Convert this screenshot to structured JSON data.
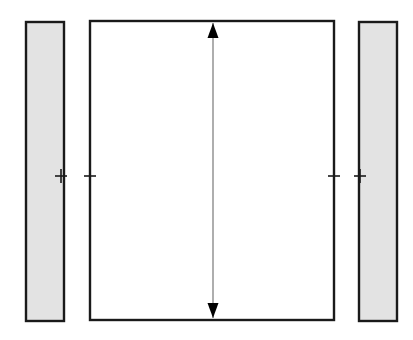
{
  "figure": {
    "type": "engineering-cross-section-diagram",
    "background_color": "#ffffff",
    "width": 413,
    "height": 340
  },
  "colors": {
    "outline": "#1a1a1a",
    "hatch_fill": "#e3e3e3",
    "panel_fill": "#ffffff",
    "arrow_shaft": "#8c8c8c",
    "arrow_head": "#000000",
    "tick_mark": "#1a1a1a"
  },
  "shapes": {
    "left_side_bar": {
      "label": "left-side-bar",
      "x": 26,
      "y": 22,
      "width": 38,
      "height": 299,
      "fill": "#e3e3e3",
      "stroke": "#1a1a1a",
      "stroke_width": 2.4
    },
    "center_panel": {
      "label": "center-panel",
      "x": 90,
      "y": 21,
      "width": 244,
      "height": 299,
      "fill": "#ffffff",
      "stroke": "#1a1a1a",
      "stroke_width": 2.4
    },
    "right_side_bar": {
      "label": "right-side-bar",
      "x": 359,
      "y": 22,
      "width": 38,
      "height": 299,
      "fill": "#e3e3e3",
      "stroke": "#1a1a1a",
      "stroke_width": 2.4
    }
  },
  "dimension_arrow": {
    "label": "vertical-dimension-arrow",
    "orientation": "vertical",
    "double_headed": true,
    "x": 213,
    "y_top": 23,
    "y_bottom": 318,
    "shaft_color": "#8c8c8c",
    "shaft_width": 1.4,
    "head_color": "#000000",
    "head_width": 11,
    "head_length": 15,
    "measures": "center-panel-height"
  },
  "tick_marks": {
    "label": "centerline-tick-marks",
    "count": 4,
    "center_y": 176,
    "arm_half_width": 6,
    "arm_half_height": 7,
    "stroke": "#1a1a1a",
    "stroke_width": 1.6,
    "positions_x": [
      61,
      90,
      334,
      360
    ]
  }
}
